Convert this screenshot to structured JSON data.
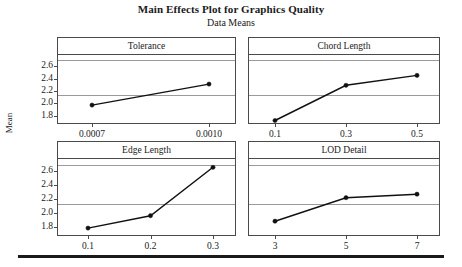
{
  "chart_data": {
    "type": "line",
    "title": "Main Effects Plot for Graphics Quality",
    "subtitle": "Data Means",
    "ylabel": "Mean",
    "xlabel": "",
    "ylim": [
      1.68,
      2.78
    ],
    "yticks": [
      "1.8",
      "2.0",
      "2.2",
      "2.4",
      "2.6"
    ],
    "ytick_values": [
      1.8,
      2.0,
      2.2,
      2.4,
      2.6
    ],
    "grid": true,
    "gridlines": [
      2.13,
      2.7
    ],
    "legend": "none",
    "layout": "2x2 panel grid",
    "panels": [
      {
        "name": "Tolerance",
        "categories": [
          "0.0007",
          "0.0010"
        ],
        "values": [
          1.97,
          2.31
        ]
      },
      {
        "name": "Chord Length",
        "categories": [
          "0.1",
          "0.3",
          "0.5"
        ],
        "values": [
          1.72,
          2.29,
          2.45
        ]
      },
      {
        "name": "Edge Length",
        "categories": [
          "0.1",
          "0.2",
          "0.3"
        ],
        "values": [
          1.78,
          1.96,
          2.66
        ]
      },
      {
        "name": "LOD Detail",
        "categories": [
          "3",
          "5",
          "7"
        ],
        "values": [
          1.88,
          2.22,
          2.27
        ]
      }
    ]
  },
  "colors": {
    "line": "#111111",
    "marker": "#111111",
    "frame": "#4a4a4a",
    "grid": "#9a9a9a",
    "rule": "#1a1a1a"
  }
}
